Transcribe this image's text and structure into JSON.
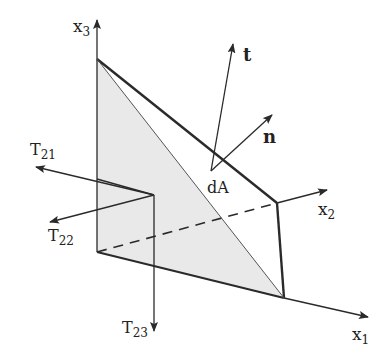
{
  "diagram": {
    "colors": {
      "stroke": "#2a2a2a",
      "shade": "#e8e8e8"
    },
    "axes": {
      "x1": {
        "base": "x",
        "sub": "1"
      },
      "x2": {
        "base": "x",
        "sub": "2"
      },
      "x3": {
        "base": "x",
        "sub": "3"
      }
    },
    "vectors": {
      "t": "t",
      "n": "n"
    },
    "area_label": "dA",
    "stress_components": [
      {
        "base": "T",
        "sub": "21"
      },
      {
        "base": "T",
        "sub": "22"
      },
      {
        "base": "T",
        "sub": "23"
      }
    ]
  }
}
